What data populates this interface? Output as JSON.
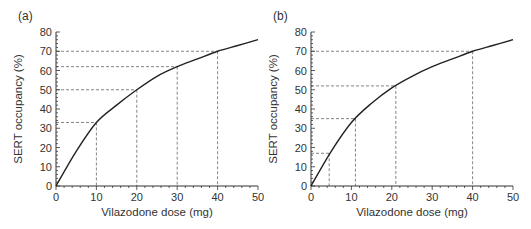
{
  "chart_data": [
    {
      "type": "line",
      "panel_label": "(a)",
      "xlabel": "Vilazodone dose (mg)",
      "ylabel": "SERT occupancy (%)",
      "xlim": [
        0,
        50
      ],
      "ylim": [
        0,
        80
      ],
      "xticks": [
        0,
        10,
        20,
        30,
        40,
        50
      ],
      "yticks": [
        0,
        10,
        20,
        30,
        40,
        50,
        60,
        70,
        80
      ],
      "grid": false,
      "curve": {
        "x": [
          0,
          5,
          10,
          15,
          20,
          25,
          30,
          35,
          40,
          45,
          50
        ],
        "y": [
          0,
          18,
          33,
          42,
          50,
          57,
          62,
          66,
          70,
          73,
          76
        ]
      },
      "reference_points": [
        {
          "x": 10,
          "y": 33
        },
        {
          "x": 20,
          "y": 50
        },
        {
          "x": 30,
          "y": 62
        },
        {
          "x": 40,
          "y": 70
        }
      ]
    },
    {
      "type": "line",
      "panel_label": "(b)",
      "xlabel": "Vilazodone dose (mg)",
      "ylabel": "SERT occupancy (%)",
      "xlim": [
        0,
        50
      ],
      "ylim": [
        0,
        80
      ],
      "xticks": [
        0,
        10,
        20,
        30,
        40,
        50
      ],
      "yticks": [
        0,
        10,
        20,
        30,
        40,
        50,
        60,
        70,
        80
      ],
      "grid": false,
      "curve": {
        "x": [
          0,
          5,
          10,
          15,
          20,
          25,
          30,
          35,
          40,
          45,
          50
        ],
        "y": [
          0,
          18,
          33,
          43,
          51,
          57,
          62,
          66,
          70,
          73,
          76
        ]
      },
      "reference_points": [
        {
          "x": 4.5,
          "y": 17
        },
        {
          "x": 11,
          "y": 35
        },
        {
          "x": 21,
          "y": 52
        },
        {
          "x": 40,
          "y": 70
        }
      ]
    }
  ]
}
